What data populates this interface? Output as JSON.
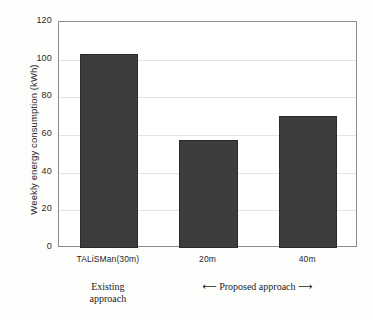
{
  "chart_data": {
    "type": "bar",
    "title": "",
    "xlabel": "",
    "ylabel": "Weekly energy consumption (kWh)",
    "categories": [
      "TALiSMan(30m)",
      "20m",
      "40m"
    ],
    "values": [
      103,
      57.5,
      70
    ],
    "ylim": [
      0,
      120
    ],
    "yticks": [
      0,
      20,
      40,
      60,
      80,
      100,
      120
    ],
    "ytick_labels": [
      "0",
      "20",
      "40",
      "60",
      "80",
      "100",
      "120"
    ],
    "grid": "horizontal",
    "legend": "none",
    "bar_color": "#3d3d3d",
    "bar_edge_color": "#2a2a2a",
    "annotations": [
      {
        "id": "existing",
        "line1": "Existing",
        "line2": "approach"
      },
      {
        "id": "proposed",
        "text": "⟵ Proposed approach ⟶"
      }
    ]
  },
  "axes": {
    "y": {
      "label": "Weekly energy consumption (kWh)",
      "ticks": [
        {
          "value": 120,
          "label": "120"
        },
        {
          "value": 100,
          "label": "100"
        },
        {
          "value": 80,
          "label": "80"
        },
        {
          "value": 60,
          "label": "60"
        },
        {
          "value": 40,
          "label": "40"
        },
        {
          "value": 20,
          "label": "20"
        },
        {
          "value": 0,
          "label": "0"
        }
      ]
    },
    "x": {
      "ticks": [
        {
          "label": "TALiSMan(30m)"
        },
        {
          "label": "20m"
        },
        {
          "label": "40m"
        }
      ]
    }
  },
  "annotations": {
    "existing_line1": "Existing",
    "existing_line2": "approach",
    "proposed_left_arrow": "⟵",
    "proposed_text": "Proposed approach",
    "proposed_right_arrow": "⟶"
  },
  "colors": {
    "bar": "#3d3d3d",
    "bar_edge": "#2a2a2a",
    "grid": "#e3e3e3",
    "axis": "#8d8d8d",
    "background": "#fdfdfc"
  }
}
